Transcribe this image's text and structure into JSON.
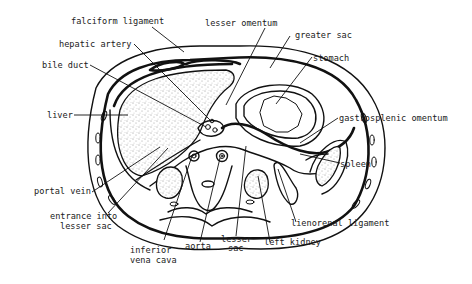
{
  "figure": {
    "labels": {
      "falciform_ligament": "falciform ligament",
      "lesser_omentum": "lesser omentum",
      "hepatic_artery": "hepatic artery",
      "greater_sac": "greater sac",
      "bile_duct": "bile duct",
      "stomach": "stomach",
      "liver": "liver",
      "gastrosplenic_omentum": "gastrosplenic omentum",
      "spleen": "spleen",
      "portal_vein": "portal vein",
      "lienorenal_ligament": "lienorenal ligament",
      "entrance_line1": "entrance into",
      "entrance_line2": "lesser sac",
      "ivc_line1": "inferior",
      "ivc_line2": "vena cava",
      "aorta": "aorta",
      "lesser_sac_line1": "lesser",
      "lesser_sac_line2": "sac",
      "left_kidney": "left kidney"
    },
    "colors": {
      "ink": "#111111",
      "background": "#ffffff",
      "text": "#1a1a1a"
    }
  }
}
